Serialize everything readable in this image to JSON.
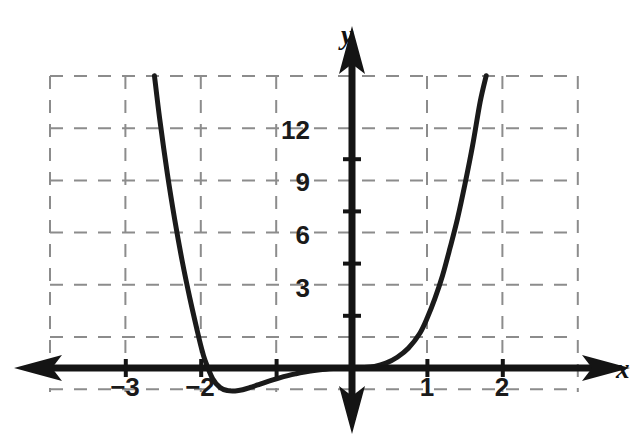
{
  "figure": {
    "background": "#ffffff",
    "curve_color": "#1a1a1a",
    "axis_color": "#141414",
    "grid_color": "#8c8c8c"
  },
  "axes": {
    "x_axis_name": "x",
    "y_axis_name": "y",
    "x_name_pos": {
      "left": 616,
      "top": 356
    },
    "y_name_pos": {
      "left": 341,
      "top": 22
    }
  },
  "chart_data": {
    "type": "line",
    "title": "",
    "xlabel": "x",
    "ylabel": "y",
    "xlim": [
      -3.6,
      3.0
    ],
    "ylim": [
      -4.8,
      16.8
    ],
    "grid": true,
    "grid_style": "dashed",
    "legend": "none",
    "x_ticks": [
      -3,
      -2,
      -1,
      1,
      2
    ],
    "x_tick_labels": [
      "−3",
      "−2",
      "−1",
      "1",
      "2"
    ],
    "x_tick_labels_visible": [
      "−3",
      "−2",
      "1",
      "2"
    ],
    "y_ticks": [
      3,
      6,
      9,
      12
    ],
    "y_tick_labels": [
      "3",
      "6",
      "9",
      "12"
    ],
    "roots": [
      -2,
      0
    ],
    "local_minimum": {
      "x": -1.55,
      "y": -1.3
    },
    "annotations": [],
    "series": [
      {
        "name": "curve",
        "x": [
          -2.62,
          -2.55,
          -2.45,
          -2.35,
          -2.25,
          -2.15,
          -2.05,
          -2.0,
          -1.95,
          -1.85,
          -1.75,
          -1.65,
          -1.55,
          -1.45,
          -1.35,
          -1.25,
          -1.15,
          -1.05,
          -0.95,
          -0.85,
          -0.75,
          -0.65,
          -0.55,
          -0.45,
          -0.35,
          -0.25,
          -0.15,
          0.0,
          0.15,
          0.3,
          0.45,
          0.6,
          0.75,
          0.9,
          1.0,
          1.1,
          1.2,
          1.3,
          1.4,
          1.5,
          1.6,
          1.7,
          1.78
        ],
        "y": [
          16.8,
          14.3,
          11.2,
          8.5,
          6.1,
          4.0,
          2.1,
          1.2,
          0.45,
          -0.6,
          -1.12,
          -1.3,
          -1.32,
          -1.25,
          -1.12,
          -0.97,
          -0.82,
          -0.68,
          -0.55,
          -0.44,
          -0.34,
          -0.25,
          -0.18,
          -0.12,
          -0.07,
          -0.035,
          -0.012,
          0.0,
          0.02,
          0.09,
          0.28,
          0.62,
          1.15,
          2.0,
          2.9,
          4.0,
          5.3,
          6.9,
          8.6,
          10.6,
          12.8,
          15.3,
          16.8
        ]
      }
    ]
  },
  "grid_geometry": {
    "left": 50,
    "right": 578,
    "top": 76,
    "bottom": 392,
    "x_axis_y": 368,
    "y_axis_x": 352,
    "x_step": 75.4,
    "y_step": 52.2
  },
  "tick_labels": {
    "y": [
      {
        "text": "12",
        "left": 286,
        "top": 117
      },
      {
        "text": "9",
        "left": 286,
        "top": 169
      },
      {
        "text": "6",
        "left": 286,
        "top": 222
      },
      {
        "text": "3",
        "left": 286,
        "top": 275
      }
    ],
    "x": [
      {
        "text": "−3",
        "left": 105,
        "top": 374
      },
      {
        "text": "−2",
        "left": 180,
        "top": 374
      },
      {
        "text": "1",
        "left": 414,
        "top": 374
      },
      {
        "text": "2",
        "left": 489,
        "top": 374
      }
    ]
  }
}
